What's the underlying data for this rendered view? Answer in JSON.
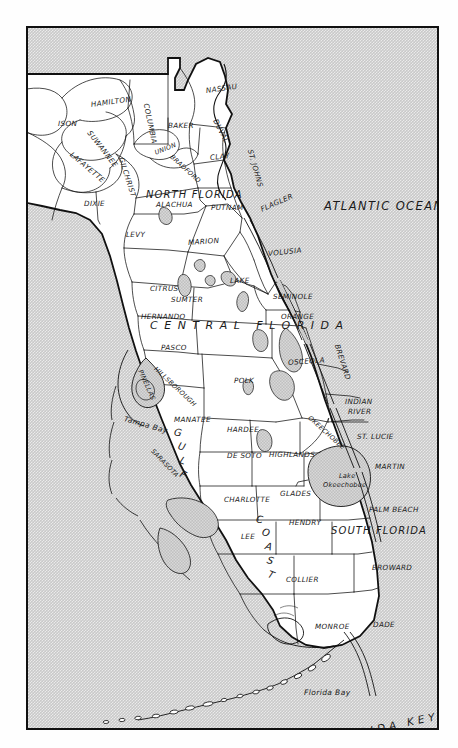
{
  "map": {
    "title": "Florida Counties and Regions Map",
    "colors": {
      "water": "#c9c9c9",
      "land": "#ffffff",
      "ink": "#111111",
      "lake": "#bfbfbf",
      "frame": "#111111"
    },
    "regions": [
      {
        "name": "NORTH FLORIDA",
        "x": 118,
        "y": 162,
        "cls": "region"
      },
      {
        "name": "CENTRAL FLORIDA",
        "x": 122,
        "y": 292,
        "cls": "region-wide"
      },
      {
        "name": "SOUTH FLORIDA",
        "x": 303,
        "y": 498,
        "cls": "region"
      }
    ],
    "water_labels": [
      {
        "name": "ATLANTIC OCEAN",
        "x": 296,
        "y": 173,
        "cls": "ocean"
      },
      {
        "name": "Tampa Bay",
        "x": 96,
        "y": 387,
        "cls": "water-lbl"
      },
      {
        "name": "Florida Bay",
        "x": 276,
        "y": 661,
        "cls": "water-lbl"
      },
      {
        "name": "FLORIDA KEYS",
        "x": 300,
        "y": 706,
        "cls": "keys-lbl"
      }
    ],
    "lake_labels": [
      {
        "name": "Lake",
        "x": 311,
        "y": 445,
        "cls": "lake-lbl"
      },
      {
        "name": "Okeechobee",
        "x": 295,
        "y": 454,
        "cls": "lake-lbl"
      }
    ],
    "coast_label": {
      "letters": [
        "G",
        "U",
        "L",
        "F"
      ],
      "letters2": [
        "C",
        "O",
        "A",
        "S",
        "T"
      ],
      "name": "GULF COAST"
    },
    "counties": [
      {
        "name": "ISON",
        "x": 30,
        "y": 92,
        "rot": 0,
        "cls": "county"
      },
      {
        "name": "HAMILTON",
        "x": 63,
        "y": 73,
        "rot": -8,
        "cls": "county"
      },
      {
        "name": "SUWANNEE",
        "x": 61,
        "y": 100,
        "rot": 52,
        "cls": "county"
      },
      {
        "name": "COLUMBIA",
        "x": 118,
        "y": 72,
        "rot": 78,
        "cls": "county"
      },
      {
        "name": "BAKER",
        "x": 140,
        "y": 94,
        "rot": 0,
        "cls": "county"
      },
      {
        "name": "NASSAU",
        "x": 178,
        "y": 59,
        "rot": -8,
        "cls": "county"
      },
      {
        "name": "DUVAL",
        "x": 187,
        "y": 88,
        "rot": 62,
        "cls": "county"
      },
      {
        "name": "LAFAYETTE",
        "x": 43,
        "y": 122,
        "rot": 40,
        "cls": "county"
      },
      {
        "name": "GILCHRIST",
        "x": 93,
        "y": 126,
        "rot": 72,
        "cls": "county"
      },
      {
        "name": "UNION",
        "x": 127,
        "y": 122,
        "rot": -22,
        "cls": "county-sm"
      },
      {
        "name": "BRADFORD",
        "x": 143,
        "y": 125,
        "rot": 42,
        "cls": "county-sm"
      },
      {
        "name": "CLAY",
        "x": 182,
        "y": 126,
        "rot": -6,
        "cls": "county"
      },
      {
        "name": "ST. JOHNS",
        "x": 222,
        "y": 118,
        "rot": 74,
        "cls": "county"
      },
      {
        "name": "DIXIE",
        "x": 56,
        "y": 172,
        "rot": 0,
        "cls": "county"
      },
      {
        "name": "ALACHUA",
        "x": 128,
        "y": 173,
        "rot": 0,
        "cls": "county"
      },
      {
        "name": "PUTNAM",
        "x": 183,
        "y": 176,
        "rot": 0,
        "cls": "county"
      },
      {
        "name": "FLAGLER",
        "x": 233,
        "y": 178,
        "rot": -24,
        "cls": "county"
      },
      {
        "name": "LEVY",
        "x": 98,
        "y": 203,
        "rot": 0,
        "cls": "county"
      },
      {
        "name": "MARION",
        "x": 160,
        "y": 211,
        "rot": -4,
        "cls": "county"
      },
      {
        "name": "VOLUSIA",
        "x": 240,
        "y": 222,
        "rot": -6,
        "cls": "county"
      },
      {
        "name": "CITRUS",
        "x": 122,
        "y": 257,
        "rot": 0,
        "cls": "county"
      },
      {
        "name": "LAKE",
        "x": 202,
        "y": 249,
        "rot": 0,
        "cls": "county"
      },
      {
        "name": "SUMTER",
        "x": 143,
        "y": 268,
        "rot": 0,
        "cls": "county"
      },
      {
        "name": "SEMINOLE",
        "x": 245,
        "y": 265,
        "rot": 0,
        "cls": "county"
      },
      {
        "name": "ORANGE",
        "x": 253,
        "y": 285,
        "rot": 0,
        "cls": "county"
      },
      {
        "name": "HERNANDO",
        "x": 113,
        "y": 285,
        "rot": 0,
        "cls": "county"
      },
      {
        "name": "PASCO",
        "x": 133,
        "y": 316,
        "rot": 0,
        "cls": "county"
      },
      {
        "name": "PINELLAS",
        "x": 112,
        "y": 339,
        "rot": 66,
        "cls": "county-sm"
      },
      {
        "name": "HILLSBOROUGH",
        "x": 127,
        "y": 337,
        "rot": 43,
        "cls": "county-sm"
      },
      {
        "name": "POLK",
        "x": 206,
        "y": 349,
        "rot": 0,
        "cls": "county"
      },
      {
        "name": "OSCEOLA",
        "x": 260,
        "y": 331,
        "rot": -4,
        "cls": "county"
      },
      {
        "name": "BREVARD",
        "x": 309,
        "y": 313,
        "rot": 72,
        "cls": "county"
      },
      {
        "name": "INDIAN",
        "x": 317,
        "y": 370,
        "rot": 0,
        "cls": "county"
      },
      {
        "name": "RIVER",
        "x": 320,
        "y": 380,
        "rot": 0,
        "cls": "county"
      },
      {
        "name": "MANATEE",
        "x": 146,
        "y": 388,
        "rot": 0,
        "cls": "county"
      },
      {
        "name": "HARDEE",
        "x": 199,
        "y": 398,
        "rot": 0,
        "cls": "county"
      },
      {
        "name": "OKEECHOBEE",
        "x": 281,
        "y": 386,
        "rot": 42,
        "cls": "county-sm"
      },
      {
        "name": "ST. LUCIE",
        "x": 329,
        "y": 405,
        "rot": 0,
        "cls": "county"
      },
      {
        "name": "SARASOTA",
        "x": 124,
        "y": 419,
        "rot": 46,
        "cls": "county-sm"
      },
      {
        "name": "DE SOTO",
        "x": 199,
        "y": 424,
        "rot": 0,
        "cls": "county"
      },
      {
        "name": "HIGHLANDS",
        "x": 241,
        "y": 423,
        "rot": 0,
        "cls": "county"
      },
      {
        "name": "MARTIN",
        "x": 347,
        "y": 435,
        "rot": 0,
        "cls": "county"
      },
      {
        "name": "CHARLOTTE",
        "x": 196,
        "y": 468,
        "rot": 0,
        "cls": "county"
      },
      {
        "name": "GLADES",
        "x": 252,
        "y": 462,
        "rot": 0,
        "cls": "county"
      },
      {
        "name": "PALM BEACH",
        "x": 341,
        "y": 478,
        "rot": 0,
        "cls": "county"
      },
      {
        "name": "HENDRY",
        "x": 261,
        "y": 491,
        "rot": 0,
        "cls": "county"
      },
      {
        "name": "LEE",
        "x": 213,
        "y": 505,
        "rot": 0,
        "cls": "county"
      },
      {
        "name": "BROWARD",
        "x": 344,
        "y": 536,
        "rot": 0,
        "cls": "county"
      },
      {
        "name": "COLLIER",
        "x": 258,
        "y": 548,
        "rot": 0,
        "cls": "county"
      },
      {
        "name": "MONROE",
        "x": 287,
        "y": 595,
        "rot": 0,
        "cls": "county"
      },
      {
        "name": "DADE",
        "x": 345,
        "y": 593,
        "rot": 0,
        "cls": "county"
      }
    ]
  }
}
